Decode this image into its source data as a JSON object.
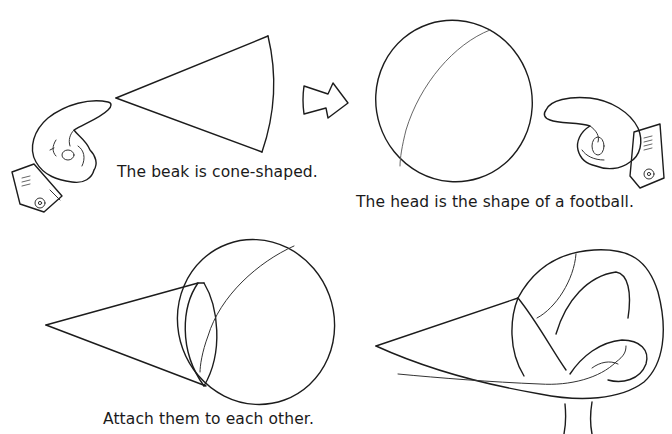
{
  "page": {
    "background": "#ffffff",
    "ink_color": "#1c1c1c"
  },
  "panels": [
    {
      "id": "beak",
      "caption": "The beak is cone-shaped.",
      "illustration": "cone-shape",
      "decoration": "pointing-hand-right"
    },
    {
      "id": "head",
      "caption": "The head is the shape of a football.",
      "illustration": "football-oval",
      "decoration": "pointing-hand-left"
    },
    {
      "id": "attach",
      "caption": "Attach them to each other.",
      "illustration": "cone-attached-to-oval"
    },
    {
      "id": "refined",
      "caption": "",
      "illustration": "refined-bird-head-sketch"
    }
  ],
  "connector": {
    "icon": "arrow-right-icon"
  }
}
